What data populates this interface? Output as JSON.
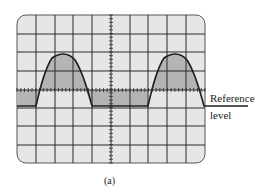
{
  "figure": {
    "type": "oscilloscope-display",
    "caption": "(a)",
    "annotation": {
      "line1": "Reference",
      "line2": "level"
    },
    "grid": {
      "columns": 10,
      "rows": 8
    },
    "waveform": "half-wave rectified sine (positive half-cycles above a reference level, flat baseline between)",
    "colors": {
      "screen": "#e6e6e6",
      "grid": "#2a2a2a",
      "shade": "#b4b4b4",
      "trace": "#1e1e1e"
    }
  }
}
